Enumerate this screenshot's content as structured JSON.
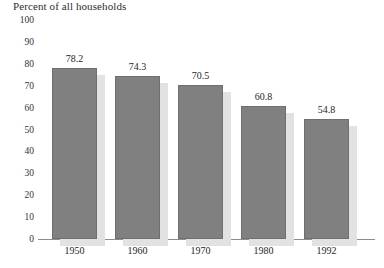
{
  "chart_data": {
    "type": "bar",
    "title": "Percent of all households",
    "xlabel": "",
    "ylabel": "",
    "ylim": [
      0,
      100
    ],
    "yticks": [
      0,
      10,
      20,
      30,
      40,
      50,
      60,
      70,
      80,
      90,
      100
    ],
    "ytick_labels": [
      "0",
      "10",
      "20",
      "30",
      "40",
      "50",
      "60",
      "70",
      "80",
      "90",
      "100"
    ],
    "categories": [
      "1950",
      "1960",
      "1970",
      "1980",
      "1992"
    ],
    "values": [
      78.2,
      74.3,
      70.5,
      60.8,
      54.8
    ],
    "value_labels": [
      "78.2",
      "74.3",
      "70.5",
      "60.8",
      "54.8"
    ],
    "grid": false,
    "legend": null,
    "series": [
      {
        "name": "Percent of all households",
        "values": [
          78.2,
          74.3,
          70.5,
          60.8,
          54.8
        ]
      }
    ],
    "colors": {
      "bar_fill": "#808080",
      "bar_border": "#6f6f6f",
      "bar_shadow": "#e2e2e2",
      "axis": "#8d8d8d",
      "text": "#2b2b2b",
      "background": "#ffffff"
    }
  }
}
